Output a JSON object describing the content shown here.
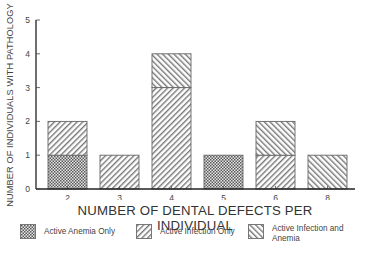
{
  "chart_data": {
    "type": "bar",
    "stacked": true,
    "title": "",
    "xlabel": "NUMBER OF DENTAL DEFECTS PER INDIVIDUAL",
    "ylabel": "NUMBER OF INDIVIDUALS WITH PATHOLOGY",
    "ylim": [
      0,
      5
    ],
    "yticks": [
      0,
      1,
      2,
      3,
      4,
      5
    ],
    "grid": false,
    "legend_position": "bottom",
    "categories": [
      "2",
      "3",
      "4",
      "5",
      "6",
      "8"
    ],
    "series": [
      {
        "name": "Active Anemia Only",
        "pattern": "crosshatch",
        "values": [
          1,
          0,
          0,
          1,
          0,
          0
        ]
      },
      {
        "name": "Active Infection Only",
        "pattern": "forward-diagonal",
        "values": [
          1,
          1,
          3,
          0,
          1,
          0
        ]
      },
      {
        "name": "Active Infection and Anemia",
        "pattern": "backward-diagonal",
        "values": [
          0,
          0,
          1,
          0,
          1,
          1
        ]
      }
    ]
  },
  "axis": {
    "ylabel": "NUMBER OF INDIVIDUALS WITH PATHOLOGY",
    "xlabel": "NUMBER OF DENTAL DEFECTS PER INDIVIDUAL"
  },
  "legend": [
    {
      "label": "Active Anemia Only"
    },
    {
      "label": "Active Infection Only"
    },
    {
      "label": "Active Infection and Anemia"
    }
  ],
  "colors": {
    "stroke": "#555555",
    "hatch": "#666666",
    "axis": "#222222"
  }
}
